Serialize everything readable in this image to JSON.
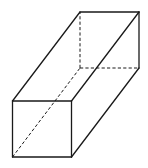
{
  "figure": {
    "line_color": "#1a1a1a",
    "background": "#ffffff",
    "vertices": {
      "A": "front-bottom-left",
      "B": "front-bottom-right",
      "C": "front-top-right",
      "D": "front-top-left",
      "E": "back-bottom-left",
      "F": "back-bottom-right",
      "G": "back-top-right",
      "H": "back-top-left"
    },
    "visible_edges": [
      [
        "A",
        "B"
      ],
      [
        "B",
        "C"
      ],
      [
        "C",
        "D"
      ],
      [
        "D",
        "A"
      ],
      [
        "D",
        "H"
      ],
      [
        "C",
        "G"
      ],
      [
        "B",
        "F"
      ],
      [
        "H",
        "G"
      ],
      [
        "G",
        "F"
      ]
    ],
    "hidden_edges": [
      [
        "A",
        "E"
      ],
      [
        "E",
        "F"
      ],
      [
        "E",
        "H"
      ]
    ]
  }
}
